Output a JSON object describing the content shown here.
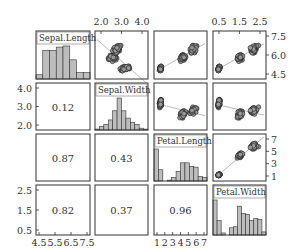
{
  "chart_data": {
    "type": "scatter",
    "title": "",
    "variables": [
      "Sepal.Length",
      "Sepal.Width",
      "Petal.Length",
      "Petal.Width"
    ],
    "ranges": {
      "Sepal.Length": [
        4.3,
        7.9
      ],
      "Sepal.Width": [
        2.0,
        4.4
      ],
      "Petal.Length": [
        1.0,
        6.9
      ],
      "Petal.Width": [
        0.1,
        2.5
      ]
    },
    "correlations": [
      {
        "row": 1,
        "col": 0,
        "value": "0.12"
      },
      {
        "row": 2,
        "col": 0,
        "value": "0.87"
      },
      {
        "row": 2,
        "col": 1,
        "value": "0.43"
      },
      {
        "row": 3,
        "col": 0,
        "value": "0.82"
      },
      {
        "row": 3,
        "col": 1,
        "value": "0.37"
      },
      {
        "row": 3,
        "col": 2,
        "value": "0.96"
      }
    ],
    "histograms": {
      "Sepal.Length": [
        4,
        27,
        27,
        30,
        31,
        18,
        6,
        6
      ],
      "Sepal.Width": [
        1,
        4,
        6,
        11,
        21,
        35,
        21,
        13,
        8,
        6,
        2,
        1
      ],
      "Petal.Length": [
        37,
        13,
        0,
        1,
        4,
        11,
        21,
        21,
        17,
        16,
        5,
        4
      ],
      "Petal.Width": [
        34,
        14,
        2,
        0,
        7,
        8,
        28,
        21,
        20,
        14,
        16,
        15,
        3
      ]
    },
    "axes": {
      "top": [
        {
          "col": 1,
          "ticks": [
            "2.0",
            "3.0",
            "4.0"
          ]
        },
        {
          "col": 3,
          "ticks": [
            "0.5",
            "1.5",
            "2.5"
          ]
        }
      ],
      "right": [
        {
          "row": 0,
          "ticks": [
            "7.5",
            "6.0",
            "4.5"
          ]
        },
        {
          "row": 2,
          "ticks": [
            "7",
            "5",
            "3",
            "1"
          ]
        }
      ],
      "left": [
        {
          "row": 1,
          "ticks": [
            "4.0",
            "3.0",
            "2.0"
          ]
        },
        {
          "row": 3,
          "ticks": [
            "2.5",
            "1.5",
            "0.5"
          ]
        }
      ],
      "bottom": [
        {
          "col": 0,
          "ticks": [
            "4.5",
            "5.5",
            "6.5",
            "7.5"
          ]
        },
        {
          "col": 2,
          "ticks": [
            "1",
            "2",
            "3",
            "4",
            "5",
            "6",
            "7"
          ]
        }
      ]
    },
    "grid": false,
    "legend": null
  },
  "colors": {
    "bar_fill": "#bdbdbd",
    "point_fill": "#999999",
    "outline": "#333333"
  }
}
